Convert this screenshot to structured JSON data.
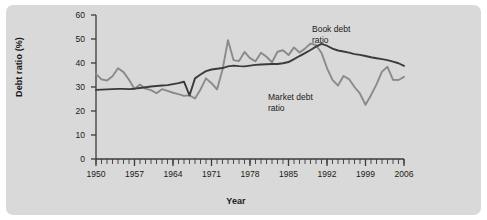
{
  "figure": {
    "background": "#ffffff",
    "panel_color": "#d9d9d9"
  },
  "chart_data": {
    "type": "line",
    "title": "",
    "xlabel": "Year",
    "ylabel": "Debt ratio (%)",
    "xlim": [
      1950,
      2006
    ],
    "ylim": [
      0,
      60
    ],
    "ytick_labels": [
      "0",
      "10",
      "20",
      "30",
      "40",
      "50",
      "60"
    ],
    "yticks": [
      0,
      10,
      20,
      30,
      40,
      50,
      60
    ],
    "xtick_labels": [
      "1950",
      "1957",
      "1964",
      "1971",
      "1978",
      "1985",
      "1992",
      "1999",
      "2006"
    ],
    "xticks": [
      1950,
      1957,
      1964,
      1971,
      1978,
      1985,
      1992,
      1999,
      2006
    ],
    "minor_xtick_interval": 1,
    "grid": false,
    "legend_position": "inline-annotation",
    "annotations": [
      {
        "name": "book-debt-ratio-label",
        "text_line1": "Book debt",
        "text_line2": "ratio",
        "x": 1996,
        "y": 55
      },
      {
        "name": "market-debt-ratio-label",
        "text_line1": "Market debt",
        "text_line2": "ratio",
        "x": 1988,
        "y": 30
      }
    ],
    "x": [
      1950,
      1951,
      1952,
      1953,
      1954,
      1955,
      1956,
      1957,
      1958,
      1959,
      1960,
      1961,
      1962,
      1963,
      1964,
      1965,
      1966,
      1967,
      1968,
      1969,
      1970,
      1971,
      1972,
      1973,
      1974,
      1975,
      1976,
      1977,
      1978,
      1979,
      1980,
      1981,
      1982,
      1983,
      1984,
      1985,
      1986,
      1987,
      1988,
      1989,
      1990,
      1991,
      1992,
      1993,
      1994,
      1995,
      1996,
      1997,
      1998,
      1999,
      2000,
      2001,
      2002,
      2003,
      2004,
      2005,
      2006
    ],
    "series": [
      {
        "name": "Book debt ratio",
        "color": "#3b3b3b",
        "linewidth": 2.0,
        "values": [
          28.8,
          28.9,
          29.0,
          29.1,
          29.2,
          29.2,
          29.1,
          29.3,
          29.6,
          29.9,
          30.2,
          30.4,
          30.6,
          30.8,
          31.2,
          31.6,
          32.2,
          26.5,
          33.6,
          35.2,
          36.6,
          37.3,
          37.6,
          37.9,
          38.6,
          38.9,
          38.7,
          38.6,
          38.9,
          39.2,
          39.4,
          39.5,
          39.6,
          39.6,
          39.9,
          40.4,
          41.6,
          42.9,
          44.1,
          45.4,
          46.8,
          48.0,
          47.2,
          46.0,
          45.2,
          44.8,
          44.3,
          43.7,
          43.4,
          42.9,
          42.4,
          42.0,
          41.6,
          41.2,
          40.6,
          39.9,
          38.8
        ]
      },
      {
        "name": "Market debt ratio",
        "color": "#8a8a8a",
        "linewidth": 2.0,
        "values": [
          35.4,
          33.2,
          32.7,
          34.5,
          37.8,
          36.2,
          33.0,
          29.2,
          31.0,
          29.3,
          28.7,
          27.4,
          29.1,
          28.4,
          27.6,
          27.0,
          26.3,
          26.5,
          25.2,
          29.0,
          33.6,
          31.6,
          29.0,
          37.2,
          49.5,
          41.2,
          40.8,
          44.6,
          42.0,
          40.7,
          44.3,
          42.6,
          40.3,
          44.7,
          45.3,
          43.3,
          46.5,
          44.4,
          46.0,
          48.1,
          47.5,
          44.2,
          37.9,
          33.0,
          30.6,
          34.6,
          33.3,
          30.0,
          27.2,
          22.6,
          26.6,
          31.1,
          36.4,
          38.4,
          33.0,
          32.9,
          34.2
        ]
      }
    ]
  }
}
